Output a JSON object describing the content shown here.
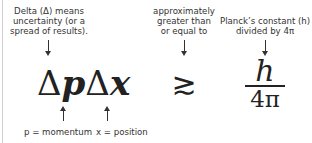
{
  "diagram": {
    "formula": {
      "left_delta_1": "Δ",
      "momentum_var": "p",
      "left_delta_2": "Δ",
      "position_var": "x",
      "relation_symbol": "≳",
      "fraction_numerator": "h",
      "fraction_denominator": "4π"
    },
    "annotations": {
      "delta": [
        "Delta (Δ) means",
        "uncertainty (or a",
        "spread of results)."
      ],
      "approx": [
        "approximately",
        "greater than",
        "or equal to"
      ],
      "planck": [
        "Planck’s constant (h)",
        "divided by 4π"
      ],
      "momentum": "p = momentum",
      "position": "x = position"
    },
    "colors": {
      "text": "#333333",
      "formula": "#222222",
      "background": "#ffffff"
    }
  }
}
